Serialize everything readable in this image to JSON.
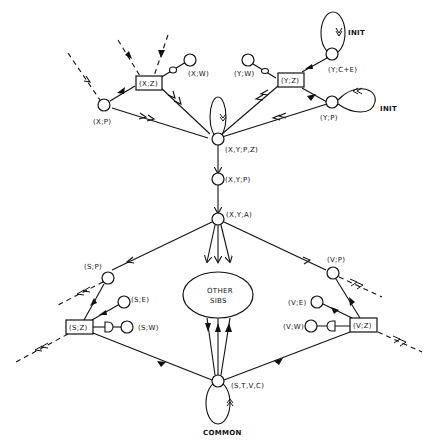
{
  "diagram": {
    "type": "state-transition / relation graph",
    "nodes": {
      "xz": "(X;Z)",
      "xw": "(X;W)",
      "xp": "(X;P)",
      "yw": "(Y;W)",
      "yz": "(Y;Z)",
      "ycpe": "(Y;C+E)",
      "yp": "(Y;P)",
      "xypz": "(X,Y;P,Z)",
      "xyp": "(X,Y;P)",
      "xya": "(X,Y;A)",
      "sp": "(S;P)",
      "se": "(S;E)",
      "sz": "(S;Z)",
      "sw": "(S;W)",
      "other1": "OTHER",
      "other2": "SIBS",
      "vp": "(V;P)",
      "ve": "(V;E)",
      "vz": "(V;Z)",
      "vw": "(V;W)",
      "stvc": "(S,T,V,C)"
    },
    "loop_labels": {
      "init_top": "INIT",
      "init_right": "INIT",
      "common": "COMMON"
    },
    "edges": [
      {
        "from": "(X;P)",
        "to": "(X;Z)",
        "style": "solid-filled-arrow"
      },
      {
        "from": "(X;P)",
        "to": "(X,Y;P,Z)",
        "style": "double-open-arrow"
      },
      {
        "from": "(X;Z)",
        "to": "(X,Y;P,Z)",
        "style": "double-open-arrow"
      },
      {
        "from": "(X;W)",
        "to": "(X;Z)",
        "style": "inhibitor"
      },
      {
        "from": "(Y;W)",
        "to": "(Y;Z)",
        "style": "inhibitor"
      },
      {
        "from": "(Y;C+E)",
        "to": "(Y;Z)",
        "style": "solid-filled-arrow"
      },
      {
        "from": "(Y;P)",
        "to": "(Y;Z)",
        "style": "solid-filled-arrow"
      },
      {
        "from": "(Y;Z)",
        "to": "(X,Y;P,Z)",
        "style": "double-open-arrow"
      },
      {
        "from": "(Y;P)",
        "to": "(X,Y;P,Z)",
        "style": "double-open-arrow"
      },
      {
        "from": "(X,Y;P,Z)",
        "to": "(X,Y;P)",
        "style": "open-arrow"
      },
      {
        "from": "(X,Y;P)",
        "to": "(X,Y;A)",
        "style": "open-arrow"
      },
      {
        "from": "(X,Y;A)",
        "to": "(S;P)",
        "style": "open-arrow"
      },
      {
        "from": "(X,Y;A)",
        "to": "(V;P)",
        "style": "open-arrow"
      },
      {
        "from": "(X,Y;A)",
        "to": "OTHER SIBS",
        "style": "open-arrow x3"
      },
      {
        "from": "(S;P)",
        "to": "(S;Z)",
        "style": "solid-filled-arrow"
      },
      {
        "from": "(S;E)",
        "to": "(S;Z)",
        "style": "solid-filled-arrow"
      },
      {
        "from": "(S;W)",
        "to": "(S;Z)",
        "style": "inhibitor"
      },
      {
        "from": "(V;P)",
        "to": "(V;Z)",
        "style": "solid-filled-arrow"
      },
      {
        "from": "(V;E)",
        "to": "(V;Z)",
        "style": "solid-filled-arrow"
      },
      {
        "from": "(V;W)",
        "to": "(V;Z)",
        "style": "inhibitor"
      },
      {
        "from": "(S,T,V,C)",
        "to": "(S;Z)",
        "style": "solid-filled-arrow"
      },
      {
        "from": "(S,T,V,C)",
        "to": "(V;Z)",
        "style": "solid-filled-arrow"
      },
      {
        "from": "(S,T,V,C)",
        "to": "OTHER SIBS",
        "style": "solid-filled-arrow x3"
      }
    ]
  }
}
